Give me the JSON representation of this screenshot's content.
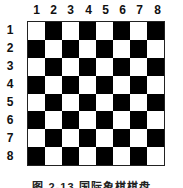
{
  "columns": [
    "1",
    "2",
    "3",
    "4",
    "5",
    "6",
    "7",
    "8"
  ],
  "rows": [
    "1",
    "2",
    "3",
    "4",
    "5",
    "6",
    "7",
    "8"
  ],
  "board": {
    "size": 8,
    "first_cell_color": "white",
    "colors": {
      "dark": "#000000",
      "light": "#ffffff"
    }
  },
  "caption": "图 2-13  国际象棋棋盘"
}
